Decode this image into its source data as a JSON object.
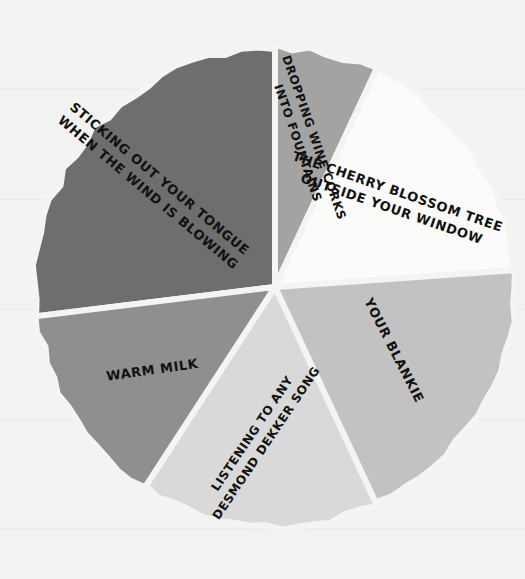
{
  "background": {
    "paper_color": "#f2f2f0",
    "rule_color": "#8c8c96"
  },
  "chart_data": {
    "type": "pie",
    "title": "",
    "subtitle": "",
    "xlabel": "",
    "ylabel": "",
    "legend_position": "none",
    "grid": false,
    "center": {
      "x": 275,
      "y": 287
    },
    "radius": 240,
    "gap_color": "#f4f4f2",
    "categories": [
      "STICKING OUT YOUR TONGUE WHEN THE WIND IS BLOWING",
      "DROPPING WINE CORKS INTO FOUNTAINS",
      "THE CHERRY BLOSSOM TREE OUTSIDE YOUR WINDOW",
      "YOUR BLANKIE",
      "LISTENING TO ANY DESMOND DEKKER SONG",
      "WARM MILK"
    ],
    "values": [
      27,
      7,
      17,
      19,
      16,
      14
    ],
    "colors": [
      "#6e6e6e",
      "#a3a3a3",
      "#fbfbfa",
      "#c2c2c2",
      "#d9d9d9",
      "#8f8f8f"
    ],
    "slices": [
      {
        "label_line1": "STICKING OUT YOUR TONGUE",
        "label_line2": "WHEN THE WIND IS BLOWING",
        "value": 27,
        "color": "#6e6e6e",
        "start_angle": 263,
        "end_angle": 360,
        "label_angle": 310,
        "label_radius": 158,
        "text_rotation": 40,
        "font_size": 13
      },
      {
        "label_line1": "DROPPING WINE CORKS",
        "label_line2": "INTO FOUNTAINS",
        "value": 7,
        "color": "#a3a3a3",
        "start_angle": 0,
        "end_angle": 25,
        "label_angle": 12,
        "label_radius": 150,
        "text_rotation": 71,
        "font_size": 12
      },
      {
        "label_line1": "THE CHERRY BLOSSOM TREE",
        "label_line2": "OUTSIDE YOUR WINDOW",
        "value": 17,
        "color": "#fbfbfa",
        "start_angle": 25,
        "end_angle": 86,
        "label_angle": 54,
        "label_radius": 148,
        "text_rotation": 19,
        "font_size": 13
      },
      {
        "label_line1": "YOUR BLANKIE",
        "label_line2": "",
        "value": 19,
        "color": "#c2c2c2",
        "start_angle": 86,
        "end_angle": 155,
        "label_angle": 118,
        "label_radius": 135,
        "text_rotation": 63,
        "font_size": 13
      },
      {
        "label_line1": "LISTENING TO ANY",
        "label_line2": "DESMOND DEKKER SONG",
        "value": 16,
        "color": "#d9d9d9",
        "start_angle": 155,
        "end_angle": 213,
        "label_angle": 186,
        "label_radius": 152,
        "text_rotation": -56,
        "font_size": 12
      },
      {
        "label_line1": "WARM MILK",
        "label_line2": "",
        "value": 14,
        "color": "#8f8f8f",
        "start_angle": 213,
        "end_angle": 263,
        "label_angle": 236,
        "label_radius": 148,
        "text_rotation": -8,
        "font_size": 13
      }
    ]
  }
}
